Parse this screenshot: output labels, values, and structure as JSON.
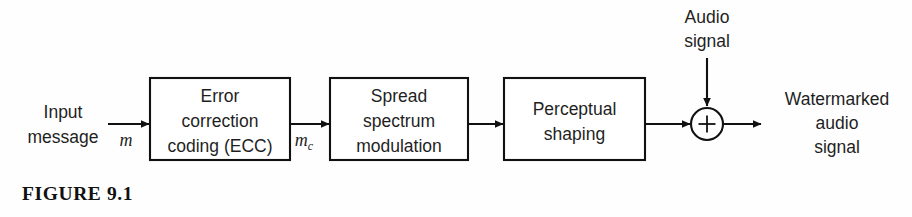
{
  "figure": {
    "caption": "FIGURE 9.1",
    "domain": "block-diagram"
  },
  "colors": {
    "stroke": "#111111",
    "text": "#1f1f1f",
    "background": "#fefefe",
    "box_fill": "#ffffff"
  },
  "inputs": {
    "message": {
      "line1": "Input",
      "line2": "message",
      "signal": "m"
    },
    "audio": {
      "line1": "Audio",
      "line2": "signal"
    }
  },
  "blocks": [
    {
      "id": "ecc",
      "lines": [
        "Error",
        "correction",
        "coding (ECC)"
      ]
    },
    {
      "id": "spread-spectrum",
      "lines": [
        "Spread",
        "spectrum",
        "modulation"
      ]
    },
    {
      "id": "perceptual-shaping",
      "lines": [
        "Perceptual",
        "shaping"
      ]
    }
  ],
  "intermediate_signals": {
    "coded_message_base": "m",
    "coded_message_sub": "c"
  },
  "adder": {
    "symbol": "+"
  },
  "output": {
    "line1": "Watermarked",
    "line2": "audio",
    "line3": "signal"
  }
}
